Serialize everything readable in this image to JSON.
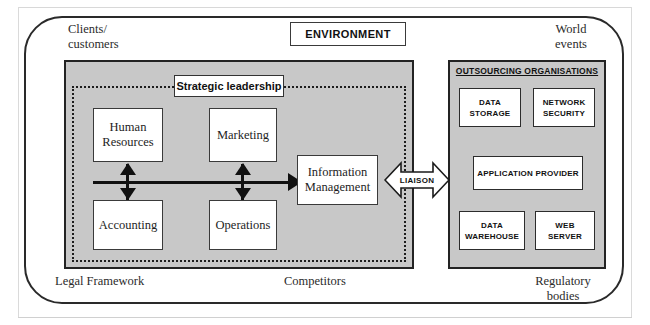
{
  "environment": {
    "title": "ENVIRONMENT",
    "labels": {
      "clients": "Clients/\ncustomers",
      "world_events": "World\nevents",
      "legal_framework": "Legal Framework",
      "competitors": "Competitors",
      "regulatory_bodies": "Regulatory\nbodies"
    }
  },
  "organisation": {
    "strategic_leadership": "Strategic leadership",
    "functions": [
      {
        "id": "human-resources",
        "label": "Human\nResources"
      },
      {
        "id": "marketing",
        "label": "Marketing"
      },
      {
        "id": "accounting",
        "label": "Accounting"
      },
      {
        "id": "operations",
        "label": "Operations"
      },
      {
        "id": "information-management",
        "label": "Information\nManagement"
      }
    ]
  },
  "liaison": {
    "label": "LIAISON"
  },
  "outsourcing": {
    "title": "OUTSOURCING ORGANISATIONS",
    "providers": [
      {
        "id": "data-storage",
        "label": "DATA\nSTORAGE"
      },
      {
        "id": "network-security",
        "label": "NETWORK\nSECURITY"
      },
      {
        "id": "application-provider",
        "label": "APPLICATION  PROVIDER"
      },
      {
        "id": "data-warehouse",
        "label": "DATA\nWAREHOUSE"
      },
      {
        "id": "web-server",
        "label": "WEB\nSERVER"
      }
    ]
  },
  "colors": {
    "panel_fill": "#c8c8c8",
    "panel_border": "#232323",
    "box_fill": "#ffffff",
    "line": "#111111"
  }
}
